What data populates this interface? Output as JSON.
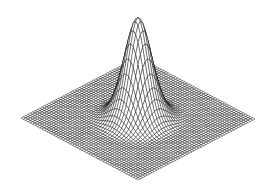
{
  "figure": {
    "title": "",
    "background_color": "#ffffff",
    "line_color": "#000000",
    "face_color": "#ffffff",
    "width_px": 271,
    "height_px": 190
  },
  "chart_data": {
    "type": "surface",
    "render_style": "wireframe-mesh",
    "title": "",
    "subtitle": "",
    "xlabel": "",
    "ylabel": "",
    "zlabel": "",
    "grid": false,
    "axes_visible": false,
    "tick_labels_visible": false,
    "legend": null,
    "legend_position": "none",
    "annotations": [],
    "function": "z = exp(-(x^2 + y^2) / (2 * 0.52^2))",
    "x": {
      "min": -3,
      "max": 3,
      "divisions": 50
    },
    "y": {
      "min": -3,
      "max": 3,
      "divisions": 50
    },
    "z": {
      "min": 0,
      "max": 1
    },
    "xlim": [
      -3,
      3
    ],
    "ylim": [
      -3,
      3
    ],
    "zlim": [
      0,
      1
    ],
    "peak": {
      "x": 0,
      "y": 0,
      "z": 1.0
    },
    "sigma": 0.52,
    "ripple_amplitude": 0.012,
    "ripple_frequency": 5.5,
    "projection": {
      "type": "axonometric",
      "base_left_corner_px": [
        21,
        118
      ],
      "base_right_corner_px": [
        255,
        119
      ],
      "base_front_corner_px": [
        138,
        180
      ],
      "base_back_corner_px": [
        138,
        57
      ],
      "apex_px": [
        140,
        18
      ],
      "z_scale_px": 100
    }
  }
}
